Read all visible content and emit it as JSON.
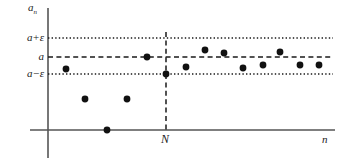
{
  "figure": {
    "background_color": "#ffffff",
    "ink_color": "#1a1a1a",
    "axis_color": "#555555"
  },
  "labels": {
    "y_axis": "a",
    "y_axis_subscript": "n",
    "x_axis": "n",
    "threshold": "N",
    "tick_upper_a": "a",
    "tick_upper_op": "+",
    "tick_upper_eps": "ε",
    "tick_mid": "a",
    "tick_lower_a": "a",
    "tick_lower_op": "−",
    "tick_lower_eps": "ε"
  },
  "chart_data": {
    "type": "scatter",
    "title": "",
    "xlabel": "n",
    "ylabel": "a_n",
    "grid": false,
    "legend": "none",
    "axes": {
      "y_axis_x_px": 48,
      "y_axis_top_px": 8,
      "y_axis_bottom_px": 158,
      "x_axis_y_px": 130,
      "x_axis_left_px": 30,
      "x_axis_right_px": 335
    },
    "reference_lines": [
      {
        "name": "a-plus-epsilon",
        "label": "a+ε",
        "value_px_y": 38,
        "style": "dotted",
        "orientation": "horizontal",
        "x_start_px": 48,
        "x_end_px": 333
      },
      {
        "name": "a",
        "label": "a",
        "value_px_y": 57,
        "style": "dashed",
        "orientation": "horizontal",
        "x_start_px": 48,
        "x_end_px": 333
      },
      {
        "name": "a-minus-epsilon",
        "label": "a−ε",
        "value_px_y": 74,
        "style": "dotted",
        "orientation": "horizontal",
        "x_start_px": 48,
        "x_end_px": 333
      },
      {
        "name": "N-threshold",
        "label": "N",
        "value_px_x": 166,
        "style": "dashed",
        "orientation": "vertical",
        "y_start_px": 32,
        "y_end_px": 130
      }
    ],
    "points_px": [
      {
        "x": 66,
        "y": 69
      },
      {
        "x": 85,
        "y": 99
      },
      {
        "x": 107,
        "y": 130
      },
      {
        "x": 127,
        "y": 99
      },
      {
        "x": 147,
        "y": 57
      },
      {
        "x": 166,
        "y": 74
      },
      {
        "x": 186,
        "y": 67
      },
      {
        "x": 205,
        "y": 50
      },
      {
        "x": 224,
        "y": 53
      },
      {
        "x": 243,
        "y": 68
      },
      {
        "x": 263,
        "y": 65
      },
      {
        "x": 280,
        "y": 52
      },
      {
        "x": 300,
        "y": 65
      },
      {
        "x": 319,
        "y": 65
      }
    ],
    "point_radius_px": 3.4,
    "point_color": "#111111",
    "note": "Points before N wander outside the epsilon band; points at and after N stay inside (a-eps, a+eps)."
  }
}
